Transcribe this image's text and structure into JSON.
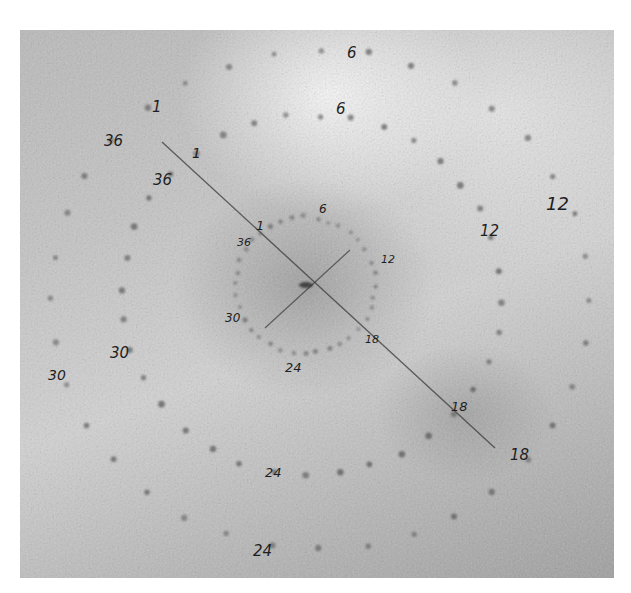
{
  "image": {
    "description": "Photograph of a grayscale dot pattern (three concentric dotted rings) with handwritten numeric markers and a diagonal ruled line",
    "colors": {
      "background": "#c2c2c2",
      "dot": "#555555",
      "ink": "#1e1e1e"
    }
  },
  "rings": [
    {
      "name": "inner",
      "labels": [
        "1",
        "36",
        "6",
        "12",
        "18",
        "24",
        "30"
      ]
    },
    {
      "name": "middle",
      "labels": [
        "1",
        "36",
        "6",
        "12",
        "18",
        "24",
        "30"
      ]
    },
    {
      "name": "outer",
      "labels": [
        "1",
        "36",
        "6",
        "12",
        "18",
        "24",
        "30"
      ]
    }
  ],
  "annotations": {
    "outer_1": "1",
    "outer_36": "36",
    "outer_6": "6",
    "outer_12": "12",
    "outer_18": "18",
    "outer_24": "24",
    "outer_30": "30",
    "middle_1": "1",
    "middle_36": "36",
    "middle_6": "6",
    "middle_12": "12",
    "middle_18": "18",
    "middle_24": "24",
    "middle_30": "30",
    "inner_1": "1",
    "inner_36": "36",
    "inner_6": "6",
    "inner_12": "12",
    "inner_18": "18",
    "inner_24": "24",
    "inner_30": "30"
  }
}
